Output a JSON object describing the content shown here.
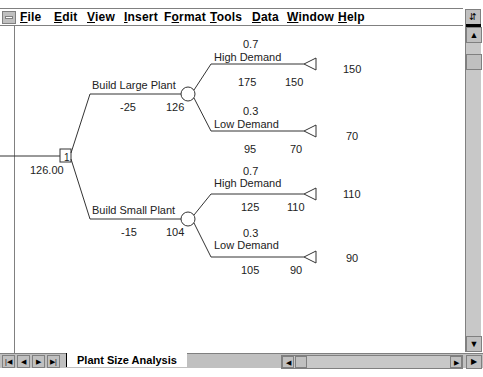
{
  "menubar": {
    "items": [
      "File",
      "Edit",
      "View",
      "Insert",
      "Format",
      "Tools",
      "Data",
      "Window",
      "Help"
    ],
    "mnemonics": [
      "F",
      "E",
      "V",
      "I",
      "o",
      "T",
      "D",
      "W",
      "H"
    ]
  },
  "tree": {
    "root_value": "126.00",
    "decision_node_label": "1",
    "branches": [
      {
        "label": "Build Large Plant",
        "cost": "-25",
        "ev": "126",
        "outcomes": [
          {
            "prob": "0.7",
            "label": "High Demand",
            "value": "175",
            "cum": "150",
            "payoff": "150"
          },
          {
            "prob": "0.3",
            "label": "Low Demand",
            "value": "95",
            "cum": "70",
            "payoff": "70"
          }
        ]
      },
      {
        "label": "Build Small Plant",
        "cost": "-15",
        "ev": "104",
        "outcomes": [
          {
            "prob": "0.7",
            "label": "High Demand",
            "value": "125",
            "cum": "110",
            "payoff": "110"
          },
          {
            "prob": "0.3",
            "label": "Low Demand",
            "value": "105",
            "cum": "90",
            "payoff": "90"
          }
        ]
      }
    ]
  },
  "sheet_tabs": {
    "active": "Plant Size Analysis"
  }
}
